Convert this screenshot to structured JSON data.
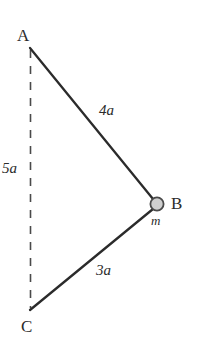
{
  "figure": {
    "background_color": "#ffffff",
    "stroke_color": "#2b2b2b",
    "mass_fill_color": "#cccccc",
    "mass_stroke_color": "#4a4a4a",
    "width": 197,
    "height": 346
  },
  "vertices": {
    "A": {
      "label": "A",
      "x": 30,
      "y": 48
    },
    "B": {
      "label": "B",
      "x": 157,
      "y": 204
    },
    "C": {
      "label": "C",
      "x": 30,
      "y": 310
    }
  },
  "mass": {
    "label": "m",
    "center_x": 157,
    "center_y": 204,
    "radius": 7
  },
  "members": [
    {
      "name": "rod-AB",
      "label": "4a",
      "from": "A",
      "to": "B",
      "style": "solid"
    },
    {
      "name": "rod-CB",
      "label": "3a",
      "from": "C",
      "to": "B",
      "style": "solid"
    },
    {
      "name": "axis-AC",
      "label": "5a",
      "from": "A",
      "to": "C",
      "style": "dashed"
    }
  ],
  "labels": {
    "vertex_a": "A",
    "vertex_b": "B",
    "vertex_c": "C",
    "length_ab": "4a",
    "length_cb": "3a",
    "length_ac": "5a",
    "mass_symbol": "m"
  }
}
